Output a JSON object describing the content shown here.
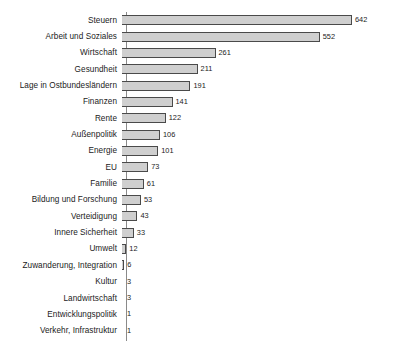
{
  "chart_data": {
    "type": "bar",
    "orientation": "horizontal",
    "title": "",
    "subtitle": "",
    "xlabel": "",
    "ylabel": "",
    "xlim": [
      0,
      642
    ],
    "grid": false,
    "legend": false,
    "value_labels": true,
    "bar_fill_color": "#cfcfcf",
    "bar_border_color": "#4a4a4a",
    "axis_color": "#8a8a8a",
    "text_color": "#1b1b1b",
    "categories": [
      "Steuern",
      "Arbeit und Soziales",
      "Wirtschaft",
      "Gesundheit",
      "Lage in Ostbundesländern",
      "Finanzen",
      "Rente",
      "Außenpolitik",
      "Energie",
      "EU",
      "Familie",
      "Bildung und Forschung",
      "Verteidigung",
      "Innere Sicherheit",
      "Umwelt",
      "Zuwanderung, Integration",
      "Kultur",
      "Landwirtschaft",
      "Entwicklungspolitik",
      "Verkehr, Infrastruktur"
    ],
    "values": [
      642,
      552,
      261,
      211,
      191,
      141,
      122,
      106,
      101,
      73,
      61,
      53,
      43,
      33,
      12,
      6,
      3,
      3,
      1,
      1
    ],
    "bars": [
      {
        "label": "Steuern",
        "value": 642,
        "value_label": "642"
      },
      {
        "label": "Arbeit und Soziales",
        "value": 552,
        "value_label": "552"
      },
      {
        "label": "Wirtschaft",
        "value": 261,
        "value_label": "261"
      },
      {
        "label": "Gesundheit",
        "value": 211,
        "value_label": "211"
      },
      {
        "label": "Lage in Ostbundesländern",
        "value": 191,
        "value_label": "191"
      },
      {
        "label": "Finanzen",
        "value": 141,
        "value_label": "141"
      },
      {
        "label": "Rente",
        "value": 122,
        "value_label": "122"
      },
      {
        "label": "Außenpolitik",
        "value": 106,
        "value_label": "106"
      },
      {
        "label": "Energie",
        "value": 101,
        "value_label": "101"
      },
      {
        "label": "EU",
        "value": 73,
        "value_label": "73"
      },
      {
        "label": "Familie",
        "value": 61,
        "value_label": "61"
      },
      {
        "label": "Bildung und Forschung",
        "value": 53,
        "value_label": "53"
      },
      {
        "label": "Verteidigung",
        "value": 43,
        "value_label": "43"
      },
      {
        "label": "Innere Sicherheit",
        "value": 33,
        "value_label": "33"
      },
      {
        "label": "Umwelt",
        "value": 12,
        "value_label": "12"
      },
      {
        "label": "Zuwanderung, Integration",
        "value": 6,
        "value_label": "6"
      },
      {
        "label": "Kultur",
        "value": 3,
        "value_label": "3"
      },
      {
        "label": "Landwirtschaft",
        "value": 3,
        "value_label": "3"
      },
      {
        "label": "Entwicklungspolitik",
        "value": 1,
        "value_label": "1"
      },
      {
        "label": "Verkehr, Infrastruktur",
        "value": 1,
        "value_label": "1"
      }
    ]
  }
}
